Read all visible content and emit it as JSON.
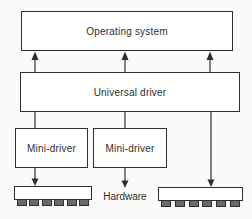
{
  "diagram": {
    "nodes": {
      "operating_system": {
        "label": "Operating system"
      },
      "universal_driver": {
        "label": "Universal driver"
      },
      "mini_driver_1": {
        "label": "Mini-driver"
      },
      "mini_driver_2": {
        "label": "Mini-driver"
      },
      "hardware": {
        "label": "Hardware"
      }
    },
    "edges": [
      {
        "from": "universal_driver",
        "to": "operating_system",
        "direction": "up",
        "arrowhead": true,
        "count": 3
      },
      {
        "from": "universal_driver",
        "to": "mini_driver_1",
        "direction": "down",
        "arrowhead": false
      },
      {
        "from": "universal_driver",
        "to": "mini_driver_2",
        "direction": "down",
        "arrowhead": false
      },
      {
        "from": "universal_driver",
        "to": "hardware_chip_right",
        "direction": "down",
        "arrowhead": true
      },
      {
        "from": "mini_driver_1",
        "to": "hardware_chip_left",
        "direction": "down",
        "arrowhead": true
      },
      {
        "from": "mini_driver_2",
        "to": "hardware",
        "direction": "down",
        "arrowhead": true
      }
    ],
    "chips": {
      "count": 2,
      "pins_per_chip": 6
    },
    "colors": {
      "line": "#2e2e2e",
      "box_fill": "#ffffff",
      "background": "#fafaf8",
      "pin_fill": "#6a6a6a"
    }
  }
}
